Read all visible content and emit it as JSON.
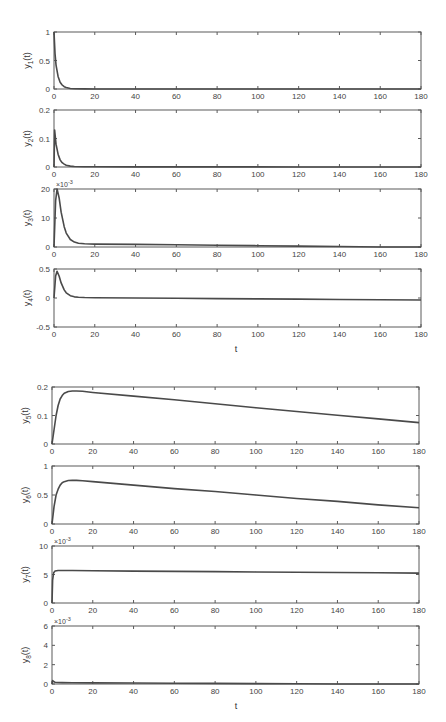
{
  "figure": {
    "panels_layout": [
      {
        "id": "y1",
        "box": [
          54,
          32,
          421,
          89
        ]
      },
      {
        "id": "y2",
        "box": [
          54,
          110,
          421,
          167
        ]
      },
      {
        "id": "y3",
        "box": [
          54,
          189,
          421,
          247
        ]
      },
      {
        "id": "y4",
        "box": [
          54,
          269,
          421,
          327
        ]
      },
      {
        "id": "y5",
        "box": [
          52,
          387,
          419,
          444
        ]
      },
      {
        "id": "y6",
        "box": [
          52,
          466,
          419,
          524
        ]
      },
      {
        "id": "y7",
        "box": [
          52,
          546,
          419,
          603
        ]
      },
      {
        "id": "y8",
        "box": [
          52,
          626,
          419,
          684
        ]
      }
    ],
    "xlabels": [
      {
        "text": "t",
        "x": 236,
        "y": 352
      },
      {
        "text": "t",
        "x": 236,
        "y": 709
      }
    ]
  },
  "chart_data": [
    {
      "type": "line",
      "title": "",
      "xlabel": "",
      "ylabel": "y1(t)",
      "ylabel_sub": "1",
      "xlim": [
        0,
        180
      ],
      "ylim": [
        0,
        1
      ],
      "xticks": [
        0,
        20,
        40,
        60,
        80,
        100,
        120,
        140,
        160,
        180
      ],
      "yticks": [
        0,
        0.5,
        1
      ],
      "ytick_labels": [
        "0",
        "0.5",
        "1"
      ],
      "exponent": "",
      "grid": false,
      "series": [
        {
          "name": "y1",
          "x": [
            0,
            0.5,
            1,
            2,
            3,
            4,
            5,
            6,
            8,
            10,
            15,
            20,
            40,
            80,
            120,
            180
          ],
          "y": [
            1,
            0.62,
            0.42,
            0.22,
            0.12,
            0.07,
            0.04,
            0.025,
            0.01,
            0.005,
            0.002,
            0.001,
            0.0005,
            0.0003,
            0.0002,
            0.0001
          ]
        }
      ]
    },
    {
      "type": "line",
      "title": "",
      "xlabel": "",
      "ylabel": "y2(t)",
      "ylabel_sub": "2",
      "xlim": [
        0,
        180
      ],
      "ylim": [
        0,
        0.2
      ],
      "xticks": [
        0,
        20,
        40,
        60,
        80,
        100,
        120,
        140,
        160,
        180
      ],
      "yticks": [
        0,
        0.1,
        0.2
      ],
      "ytick_labels": [
        "0",
        "0.1",
        "0.2"
      ],
      "exponent": "",
      "grid": false,
      "series": [
        {
          "name": "y2",
          "x": [
            0,
            0.3,
            1,
            2,
            3,
            4,
            5,
            6,
            8,
            10,
            15,
            20,
            40,
            80,
            120,
            180
          ],
          "y": [
            0,
            0.13,
            0.08,
            0.045,
            0.025,
            0.015,
            0.01,
            0.006,
            0.003,
            0.002,
            0.001,
            0.0008,
            0.0005,
            0.0003,
            0.0002,
            0.0001
          ]
        }
      ]
    },
    {
      "type": "line",
      "title": "",
      "xlabel": "",
      "ylabel": "y3(t)",
      "ylabel_sub": "3",
      "xlim": [
        0,
        180
      ],
      "ylim": [
        0,
        20
      ],
      "xticks": [
        0,
        20,
        40,
        60,
        80,
        100,
        120,
        140,
        160,
        180
      ],
      "yticks": [
        0,
        10,
        20
      ],
      "ytick_labels": [
        "0",
        "10",
        "20"
      ],
      "exponent": "×10^-3",
      "grid": false,
      "series": [
        {
          "name": "y3 (×10^-3)",
          "x": [
            0,
            0.8,
            1.5,
            2.5,
            3.5,
            5,
            6,
            8,
            10,
            12,
            15,
            20,
            40,
            60,
            80,
            100,
            120,
            140,
            160,
            180
          ],
          "y": [
            0,
            16,
            20,
            17,
            12,
            7,
            4.8,
            2.6,
            1.7,
            1.3,
            1.1,
            1.0,
            0.9,
            0.75,
            0.6,
            0.45,
            0.3,
            0.15,
            0.0,
            -0.2
          ]
        }
      ]
    },
    {
      "type": "line",
      "title": "",
      "xlabel": "t",
      "ylabel": "y4(t)",
      "ylabel_sub": "4",
      "xlim": [
        0,
        180
      ],
      "ylim": [
        -0.5,
        0.5
      ],
      "xticks": [
        0,
        20,
        40,
        60,
        80,
        100,
        120,
        140,
        160,
        180
      ],
      "yticks": [
        -0.5,
        0,
        0.5
      ],
      "ytick_labels": [
        "-0.5",
        "0",
        "0.5"
      ],
      "exponent": "",
      "grid": false,
      "series": [
        {
          "name": "y4",
          "x": [
            0,
            0.8,
            1.5,
            2.5,
            3.5,
            5,
            6,
            8,
            10,
            12,
            15,
            20,
            40,
            60,
            80,
            100,
            120,
            140,
            160,
            180
          ],
          "y": [
            0,
            0.38,
            0.46,
            0.38,
            0.26,
            0.14,
            0.09,
            0.04,
            0.02,
            0.012,
            0.008,
            0.005,
            0.0,
            -0.005,
            -0.01,
            -0.015,
            -0.02,
            -0.025,
            -0.03,
            -0.035
          ]
        }
      ]
    },
    {
      "type": "line",
      "title": "",
      "xlabel": "",
      "ylabel": "y5(t)",
      "ylabel_sub": "5",
      "xlim": [
        0,
        180
      ],
      "ylim": [
        0,
        0.2
      ],
      "xticks": [
        0,
        20,
        40,
        60,
        80,
        100,
        120,
        140,
        160,
        180
      ],
      "yticks": [
        0,
        0.1,
        0.2
      ],
      "ytick_labels": [
        "0",
        "0.1",
        "0.2"
      ],
      "exponent": "",
      "grid": false,
      "series": [
        {
          "name": "y5",
          "x": [
            0,
            1,
            2,
            3,
            4,
            5,
            6,
            8,
            10,
            12,
            15,
            20,
            40,
            60,
            80,
            100,
            120,
            140,
            160,
            180
          ],
          "y": [
            0,
            0.05,
            0.1,
            0.135,
            0.158,
            0.17,
            0.178,
            0.184,
            0.186,
            0.186,
            0.185,
            0.181,
            0.168,
            0.155,
            0.141,
            0.127,
            0.114,
            0.101,
            0.088,
            0.075
          ]
        }
      ]
    },
    {
      "type": "line",
      "title": "",
      "xlabel": "",
      "ylabel": "y6(t)",
      "ylabel_sub": "6",
      "xlim": [
        0,
        180
      ],
      "ylim": [
        0,
        1
      ],
      "xticks": [
        0,
        20,
        40,
        60,
        80,
        100,
        120,
        140,
        160,
        180
      ],
      "yticks": [
        0,
        0.5,
        1
      ],
      "ytick_labels": [
        "0",
        "0.5",
        "1"
      ],
      "exponent": "",
      "grid": false,
      "series": [
        {
          "name": "y6",
          "x": [
            0,
            1,
            2,
            3,
            4,
            5,
            6,
            8,
            10,
            12,
            15,
            20,
            40,
            60,
            80,
            100,
            120,
            140,
            160,
            180
          ],
          "y": [
            0,
            0.3,
            0.5,
            0.6,
            0.67,
            0.71,
            0.73,
            0.75,
            0.755,
            0.752,
            0.745,
            0.73,
            0.67,
            0.61,
            0.56,
            0.5,
            0.44,
            0.39,
            0.33,
            0.28
          ]
        }
      ]
    },
    {
      "type": "line",
      "title": "",
      "xlabel": "",
      "ylabel": "y7(t)",
      "ylabel_sub": "7",
      "xlim": [
        0,
        180
      ],
      "ylim": [
        0,
        10
      ],
      "xticks": [
        0,
        20,
        40,
        60,
        80,
        100,
        120,
        140,
        160,
        180
      ],
      "yticks": [
        0,
        5,
        10
      ],
      "ytick_labels": [
        "0",
        "5",
        "10"
      ],
      "exponent": "×10^-3",
      "grid": false,
      "series": [
        {
          "name": "y7 (×10^-3)",
          "x": [
            0,
            0.3,
            0.8,
            1.5,
            3,
            5,
            10,
            20,
            40,
            60,
            80,
            100,
            120,
            140,
            160,
            180
          ],
          "y": [
            0,
            4,
            5.3,
            5.6,
            5.7,
            5.7,
            5.7,
            5.65,
            5.6,
            5.55,
            5.5,
            5.45,
            5.4,
            5.35,
            5.3,
            5.25
          ]
        }
      ]
    },
    {
      "type": "line",
      "title": "",
      "xlabel": "t",
      "ylabel": "y8(t)",
      "ylabel_sub": "8",
      "xlim": [
        0,
        180
      ],
      "ylim": [
        0,
        6
      ],
      "xticks": [
        0,
        20,
        40,
        60,
        80,
        100,
        120,
        140,
        160,
        180
      ],
      "yticks": [
        0,
        2,
        4,
        6
      ],
      "ytick_labels": [
        "0",
        "2",
        "4",
        "6"
      ],
      "exponent": "×10^-3",
      "grid": false,
      "series": [
        {
          "name": "y8 (×10^-3)",
          "x": [
            0,
            0.3,
            0.8,
            1.5,
            3,
            5,
            10,
            20,
            40,
            60,
            80,
            100,
            120,
            140,
            160,
            180
          ],
          "y": [
            0,
            0.35,
            0.25,
            0.18,
            0.15,
            0.14,
            0.13,
            0.12,
            0.1,
            0.08,
            0.06,
            0.04,
            0.02,
            0.0,
            -0.02,
            -0.04
          ]
        }
      ]
    }
  ]
}
